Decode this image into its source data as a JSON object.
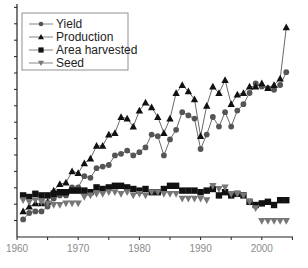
{
  "chart_data": {
    "type": "line",
    "title": "",
    "xlabel": "",
    "ylabel": "",
    "x_ticks": [
      1960,
      1970,
      1980,
      1990,
      2000
    ],
    "xlim": [
      1960,
      2005
    ],
    "ylim": [
      0,
      14
    ],
    "y_tick_labels_shown": false,
    "grid": false,
    "legend_position": "upper left",
    "x": [
      1961,
      1962,
      1963,
      1964,
      1965,
      1966,
      1967,
      1968,
      1969,
      1970,
      1971,
      1972,
      1973,
      1974,
      1975,
      1976,
      1977,
      1978,
      1979,
      1980,
      1981,
      1982,
      1983,
      1984,
      1985,
      1986,
      1987,
      1988,
      1989,
      1990,
      1991,
      1992,
      1993,
      1994,
      1995,
      1996,
      1997,
      1998,
      1999,
      2000,
      2001,
      2002,
      2003,
      2004
    ],
    "series": [
      {
        "name": "Yield",
        "marker": "circle",
        "color": "#555555",
        "values": [
          1.1,
          1.5,
          1.6,
          1.6,
          1.9,
          2.4,
          2.6,
          2.6,
          3.1,
          3.1,
          3.8,
          3.7,
          4.3,
          4.4,
          4.5,
          5.1,
          5.2,
          5.4,
          5.1,
          5.3,
          5.6,
          6.4,
          6.3,
          5.1,
          6.1,
          6.7,
          7.8,
          7.6,
          7.4,
          5.5,
          6.4,
          7.5,
          6.9,
          7.8,
          6.9,
          7.9,
          8.3,
          9.0,
          9.6,
          9.4,
          9.3,
          9.2,
          9.5,
          10.3
        ]
      },
      {
        "name": "Production",
        "marker": "triangle-up",
        "color": "#111111",
        "values": [
          1.6,
          1.9,
          2.1,
          2.1,
          2.2,
          2.9,
          3.3,
          3.4,
          4.1,
          4.0,
          4.6,
          4.9,
          5.7,
          5.7,
          6.4,
          6.5,
          7.5,
          7.4,
          6.9,
          7.9,
          8.4,
          8.1,
          7.5,
          6.5,
          7.4,
          9.0,
          9.5,
          9.1,
          8.6,
          6.3,
          8.2,
          9.4,
          9.0,
          9.8,
          8.3,
          8.9,
          9.0,
          9.4,
          9.4,
          9.6,
          9.3,
          9.5,
          9.9,
          13.1
        ]
      },
      {
        "name": "Area harvested",
        "marker": "square",
        "color": "#111111",
        "values": [
          2.6,
          2.5,
          2.7,
          2.6,
          2.6,
          2.7,
          2.8,
          2.8,
          2.9,
          2.9,
          2.9,
          2.8,
          3.1,
          3.0,
          3.1,
          3.2,
          3.2,
          3.1,
          3.0,
          2.9,
          3.0,
          2.8,
          2.8,
          3.0,
          3.2,
          3.2,
          2.9,
          2.9,
          2.9,
          2.8,
          2.9,
          3.0,
          2.6,
          2.8,
          2.6,
          2.7,
          2.6,
          2.2,
          2.0,
          2.1,
          2.2,
          2.0,
          2.3,
          2.3
        ]
      },
      {
        "name": "Seed",
        "marker": "triangle-down",
        "color": "#777777",
        "values": [
          2.3,
          2.2,
          2.3,
          2.2,
          2.1,
          2.0,
          2.0,
          2.1,
          2.1,
          2.1,
          2.5,
          2.6,
          2.7,
          2.7,
          2.8,
          2.8,
          2.7,
          2.8,
          2.6,
          2.7,
          2.6,
          2.8,
          2.8,
          2.7,
          2.7,
          2.7,
          2.4,
          2.4,
          2.4,
          2.4,
          2.3,
          3.2,
          3.0,
          3.1,
          2.7,
          2.7,
          2.6,
          2.2,
          1.8,
          1.0,
          1.0,
          1.0,
          1.0,
          1.0
        ]
      }
    ]
  },
  "legend": {
    "items": [
      {
        "label": "Yield"
      },
      {
        "label": "Production"
      },
      {
        "label": "Area harvested"
      },
      {
        "label": "Seed"
      }
    ]
  },
  "axis": {
    "x_tick_labels": [
      "1960",
      "1970",
      "1980",
      "1990",
      "2000"
    ]
  }
}
